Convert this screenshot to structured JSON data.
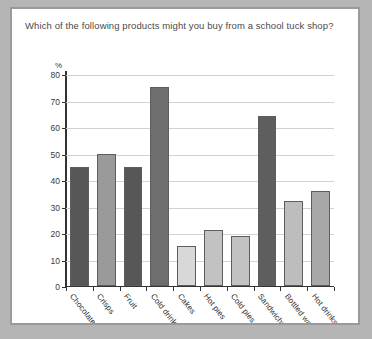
{
  "question": "Which of the following products might you buy from a school tuck shop?",
  "chart_data": {
    "type": "bar",
    "title": "",
    "subtitle": "",
    "xlabel": "",
    "ylabel": "%",
    "ylim": [
      0,
      80
    ],
    "ytick_step": 10,
    "yticks": [
      0,
      10,
      20,
      30,
      40,
      50,
      60,
      70,
      80
    ],
    "grid": true,
    "legend": "none",
    "categories": [
      "Chocolate bars",
      "Crisps",
      "Fruit",
      "Cold drinks",
      "Cakes",
      "Hot pies",
      "Cold pies",
      "Sandwiches",
      "Bottled water",
      "Hot drinks"
    ],
    "values": [
      45,
      50,
      45,
      75,
      15,
      21,
      19,
      64,
      32,
      36
    ],
    "bar_colors": [
      "#575757",
      "#9a9a9a",
      "#575757",
      "#6e6e6e",
      "#d8d8d8",
      "#c2c2c2",
      "#c2c2c2",
      "#5e5e5e",
      "#bdbdbd",
      "#a8a8a8"
    ]
  },
  "colors": {
    "page_background": "#b5b5b5",
    "card_background": "#ffffff",
    "card_border": "#9a9a9a",
    "axis": "#333333",
    "gridline": "#d2d2d2",
    "text": "#4a4a4a"
  }
}
